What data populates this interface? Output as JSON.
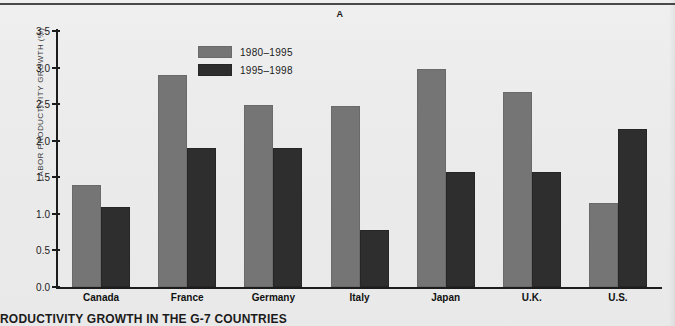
{
  "figure": {
    "panel_letter": "A",
    "caption": "RODUCTIVITY GROWTH IN THE G-7 COUNTRIES",
    "background_color": "#ebebeb"
  },
  "chart_data": {
    "type": "bar",
    "title": "A",
    "xlabel": "",
    "ylabel": "LABOR PRODUCTIVITY GROWTH (%)",
    "ylim": [
      0.0,
      3.5
    ],
    "ytick_labels": [
      "0.0",
      "0.5",
      "1.0",
      "1.5",
      "2.0",
      "2.5",
      "3.0",
      "3.5"
    ],
    "ytick_values": [
      0.0,
      0.5,
      1.0,
      1.5,
      2.0,
      2.5,
      3.0,
      3.5
    ],
    "grid": false,
    "legend_position": "upper center",
    "categories": [
      "Canada",
      "France",
      "Germany",
      "Italy",
      "Japan",
      "U.K.",
      "U.S."
    ],
    "series": [
      {
        "name": "1980-1995",
        "color": "#757575",
        "values": [
          1.4,
          2.9,
          2.49,
          2.48,
          2.98,
          2.67,
          1.15
        ]
      },
      {
        "name": "1995-1998",
        "color": "#2e2e2e",
        "values": [
          1.1,
          1.9,
          1.9,
          0.78,
          1.57,
          1.57,
          2.16
        ]
      }
    ]
  },
  "legend": {
    "entries": [
      {
        "label": "1980–1995",
        "swatch": "gray-swatch"
      },
      {
        "label": "1995–1998",
        "swatch": "dark-swatch"
      }
    ]
  }
}
